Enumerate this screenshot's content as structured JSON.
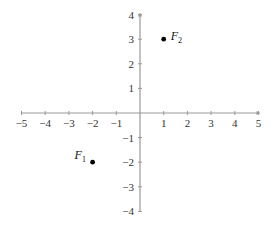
{
  "chart_data": {
    "type": "scatter",
    "title": "",
    "xlabel": "",
    "ylabel": "",
    "xlim": [
      -5,
      5
    ],
    "ylim": [
      -4,
      4
    ],
    "grid": false,
    "x_ticks": [
      -5,
      -4,
      -3,
      -2,
      -1,
      1,
      2,
      3,
      4,
      5
    ],
    "x_tick_labels": [
      "−5",
      "−4",
      "−3",
      "−2",
      "−1",
      "1",
      "2",
      "3",
      "4",
      "5"
    ],
    "y_ticks": [
      4,
      3,
      2,
      1,
      -1,
      -2,
      -3,
      -4
    ],
    "y_tick_labels": [
      "4",
      "3",
      "2",
      "1",
      "−1",
      "−2",
      "−3",
      "−4"
    ],
    "points": [
      {
        "name": "F1",
        "label": "F",
        "subscript": "1",
        "x": -2,
        "y": -2,
        "label_position": "left"
      },
      {
        "name": "F2",
        "label": "F",
        "subscript": "2",
        "x": 1,
        "y": 3,
        "label_position": "right"
      }
    ]
  },
  "colors": {
    "axis": "#999999",
    "point": "#000000",
    "text": "#333333"
  }
}
